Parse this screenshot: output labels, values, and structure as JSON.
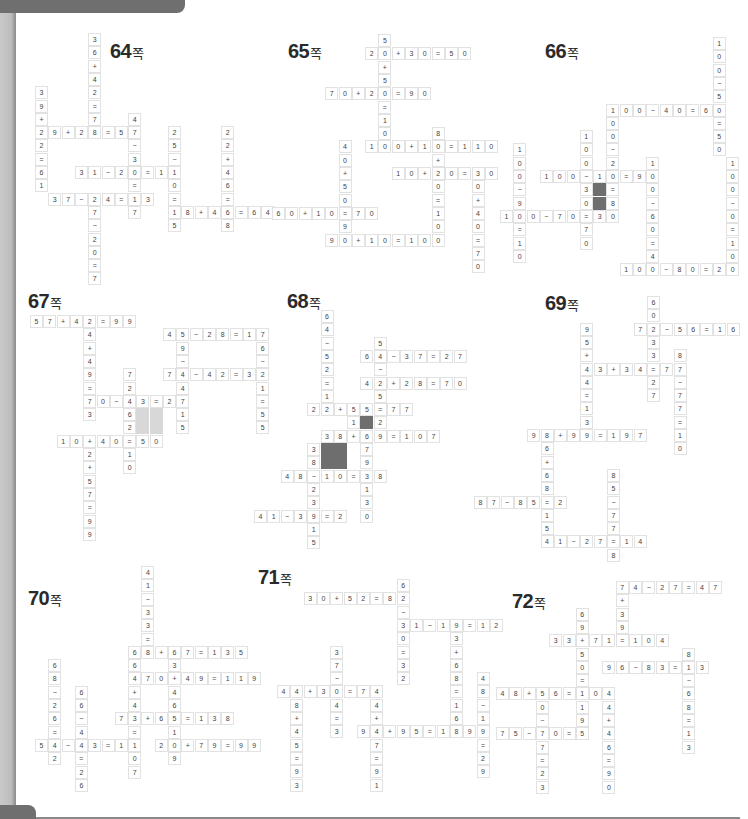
{
  "page": {
    "cell_size": 13.3,
    "shade_colors": {
      "dark": "#6e6e6e",
      "light": "#d8d8d8"
    }
  },
  "puzzles": [
    {
      "id": "p64",
      "page_label": "64",
      "unit": "쪽",
      "title_pos": [
        110,
        40
      ],
      "origin": [
        35,
        33
      ],
      "across": [
        {
          "r": 7,
          "c": 0,
          "text": "29+28=57"
        },
        {
          "r": 10,
          "c": 3,
          "text": "31-20=11"
        },
        {
          "r": 12,
          "c": 1,
          "text": "37-24=13"
        },
        {
          "r": 13,
          "c": 10,
          "text": "18+46=64"
        }
      ],
      "down": [
        {
          "r": 4,
          "c": 0,
          "text": "39+22=61"
        },
        {
          "r": 0,
          "c": 4,
          "text": "36+42=78"
        },
        {
          "r": 12,
          "c": 4,
          "text": "27-20=7"
        },
        {
          "r": 6,
          "c": 7,
          "text": "47-30=17"
        },
        {
          "r": 7,
          "c": 10,
          "text": "25-10=15"
        },
        {
          "r": 7,
          "c": 14,
          "text": "22+46=68"
        }
      ],
      "shaded": []
    },
    {
      "id": "p65",
      "page_label": "65",
      "unit": "쪽",
      "title_pos": [
        288,
        40
      ],
      "origin": [
        272,
        34
      ],
      "across": [
        {
          "r": 1,
          "c": 7,
          "text": "20+30=50"
        },
        {
          "r": 4,
          "c": 4,
          "text": "70+20=90"
        },
        {
          "r": 8,
          "c": 7,
          "text": "100+10=110"
        },
        {
          "r": 10,
          "c": 9,
          "text": "10+20=30"
        },
        {
          "r": 13,
          "c": 0,
          "text": "60+10=70"
        },
        {
          "r": 15,
          "c": 4,
          "text": "90+10=100"
        }
      ],
      "down": [
        {
          "r": 0,
          "c": 8,
          "text": "50+50=100"
        },
        {
          "r": 8,
          "c": 5,
          "text": "40+50=90"
        },
        {
          "r": 7,
          "c": 12,
          "text": "80+20=100"
        },
        {
          "r": 10,
          "c": 15,
          "text": "30+40=70"
        }
      ],
      "shaded": []
    },
    {
      "id": "p66",
      "page_label": "66",
      "unit": "쪽",
      "title_pos": [
        545,
        40
      ],
      "origin": [
        500,
        37
      ],
      "across": [
        {
          "r": 5,
          "c": 8,
          "text": "100-40=60"
        },
        {
          "r": 10,
          "c": 3,
          "text": "100-10=90"
        },
        {
          "r": 13,
          "c": 0,
          "text": "100-70=30"
        },
        {
          "r": 17,
          "c": 9,
          "text": "100-80=20"
        }
      ],
      "down": [
        {
          "r": 0,
          "c": 16,
          "text": "100-50=50"
        },
        {
          "r": 5,
          "c": 8,
          "text": "100-20=80"
        },
        {
          "r": 7,
          "c": 6,
          "text": "100-30=70"
        },
        {
          "r": 8,
          "c": 1,
          "text": "100-90=10"
        },
        {
          "r": 9,
          "c": 11,
          "text": "100-60=40"
        },
        {
          "r": 9,
          "c": 17,
          "text": "100-0=100"
        }
      ],
      "shaded": [
        {
          "r": 11,
          "c": 7,
          "type": "dark"
        },
        {
          "r": 12,
          "c": 7,
          "type": "dark"
        }
      ]
    },
    {
      "id": "p67",
      "page_label": "67",
      "unit": "쪽",
      "title_pos": [
        28,
        290
      ],
      "origin": [
        30,
        315
      ],
      "across": [
        {
          "r": 0,
          "c": 0,
          "text": "57+42=99"
        },
        {
          "r": 1,
          "c": 10,
          "text": "45-28=17"
        },
        {
          "r": 4,
          "c": 10,
          "text": "74-42=32"
        },
        {
          "r": 6,
          "c": 4,
          "text": "70-43=27"
        },
        {
          "r": 9,
          "c": 2,
          "text": "10+40=50"
        }
      ],
      "down": [
        {
          "r": 0,
          "c": 4,
          "text": "24+49=73"
        },
        {
          "r": 9,
          "c": 4,
          "text": "42+57=99"
        },
        {
          "r": 4,
          "c": 7,
          "text": "72-62=10"
        },
        {
          "r": 1,
          "c": 11,
          "text": "59-44=15"
        },
        {
          "r": 1,
          "c": 17,
          "text": "76-21=55"
        }
      ],
      "shaded": [
        {
          "r": 7,
          "c": 8,
          "type": "light"
        },
        {
          "r": 7,
          "c": 9,
          "type": "light"
        },
        {
          "r": 8,
          "c": 8,
          "type": "light"
        },
        {
          "r": 8,
          "c": 9,
          "type": "light"
        }
      ]
    },
    {
      "id": "p68",
      "page_label": "68",
      "unit": "쪽",
      "title_pos": [
        287,
        290
      ],
      "origin": [
        254,
        310
      ],
      "across": [
        {
          "r": 3,
          "c": 8,
          "text": "64-37=27"
        },
        {
          "r": 5,
          "c": 8,
          "text": "42+28=70"
        },
        {
          "r": 7,
          "c": 4,
          "text": "22+55=77"
        },
        {
          "r": 9,
          "c": 5,
          "text": "38+69=107"
        },
        {
          "r": 12,
          "c": 2,
          "text": "48-10=38"
        },
        {
          "r": 15,
          "c": 0,
          "text": "41-39=2"
        }
      ],
      "down": [
        {
          "r": 0,
          "c": 5,
          "text": "64-52=12"
        },
        {
          "r": 2,
          "c": 9,
          "text": "54-25=29"
        },
        {
          "r": 8,
          "c": 7,
          "text": "1"
        },
        {
          "r": 10,
          "c": 4,
          "text": "38-23=15"
        },
        {
          "r": 10,
          "c": 8,
          "text": "79-130"
        }
      ],
      "shaded": [
        {
          "r": 8,
          "c": 8,
          "type": "dark"
        },
        {
          "r": 10,
          "c": 5,
          "type": "dark"
        },
        {
          "r": 10,
          "c": 6,
          "type": "dark"
        },
        {
          "r": 11,
          "c": 5,
          "type": "dark"
        },
        {
          "r": 11,
          "c": 6,
          "type": "dark"
        }
      ]
    },
    {
      "id": "p69",
      "page_label": "69",
      "unit": "쪽",
      "title_pos": [
        545,
        292
      ],
      "origin": [
        474,
        296
      ],
      "across": [
        {
          "r": 2,
          "c": 12,
          "text": "72-56=16"
        },
        {
          "r": 5,
          "c": 8,
          "text": "43+34=77"
        },
        {
          "r": 10,
          "c": 4,
          "text": "98+99=197"
        },
        {
          "r": 15,
          "c": 0,
          "text": "87-85=2"
        },
        {
          "r": 18,
          "c": 5,
          "text": "41-27=14"
        }
      ],
      "down": [
        {
          "r": 0,
          "c": 13,
          "text": "60-33=27"
        },
        {
          "r": 2,
          "c": 8,
          "text": "95+44=139"
        },
        {
          "r": 4,
          "c": 15,
          "text": "87-77=10"
        },
        {
          "r": 10,
          "c": 5,
          "text": "86+68=154"
        },
        {
          "r": 13,
          "c": 10,
          "text": "85-77=8"
        }
      ],
      "shaded": []
    },
    {
      "id": "p70",
      "page_label": "70",
      "unit": "쪽",
      "title_pos": [
        28,
        587
      ],
      "origin": [
        35,
        566
      ],
      "across": [
        {
          "r": 6,
          "c": 7,
          "text": "68+67=135"
        },
        {
          "r": 8,
          "c": 8,
          "text": "70+49=119"
        },
        {
          "r": 11,
          "c": 6,
          "text": "73+65=138"
        },
        {
          "r": 13,
          "c": 0,
          "text": "54-43=11"
        },
        {
          "r": 13,
          "c": 9,
          "text": "20+79=99"
        }
      ],
      "down": [
        {
          "r": 0,
          "c": 8,
          "text": "41-33=8"
        },
        {
          "r": 6,
          "c": 10,
          "text": "63+46=109"
        },
        {
          "r": 7,
          "c": 1,
          "text": "68-26=42"
        },
        {
          "r": 7,
          "c": 7,
          "text": "64+43=107"
        },
        {
          "r": 9,
          "c": 3,
          "text": "66-40=26"
        }
      ],
      "shaded": []
    },
    {
      "id": "p71",
      "page_label": "71",
      "unit": "쪽",
      "title_pos": [
        258,
        566
      ],
      "origin": [
        277,
        579
      ],
      "across": [
        {
          "r": 1,
          "c": 2,
          "text": "30+52=82"
        },
        {
          "r": 3,
          "c": 9,
          "text": "31-19=12"
        },
        {
          "r": 8,
          "c": 0,
          "text": "44+30=74"
        },
        {
          "r": 11,
          "c": 6,
          "text": "94+95=189"
        }
      ],
      "down": [
        {
          "r": 0,
          "c": 9,
          "text": "62-30=32"
        },
        {
          "r": 5,
          "c": 4,
          "text": "37-34=3"
        },
        {
          "r": 3,
          "c": 13,
          "text": "93+68=161"
        },
        {
          "r": 8,
          "c": 1,
          "text": "48+45=93"
        },
        {
          "r": 8,
          "c": 7,
          "text": "44+47=91"
        },
        {
          "r": 7,
          "c": 15,
          "text": "48-19=29"
        }
      ],
      "shaded": []
    },
    {
      "id": "p72",
      "page_label": "72",
      "unit": "쪽",
      "title_pos": [
        512,
        590
      ],
      "origin": [
        496,
        581
      ],
      "across": [
        {
          "r": 0,
          "c": 9,
          "text": "74-27=47"
        },
        {
          "r": 4,
          "c": 4,
          "text": "33+71=104"
        },
        {
          "r": 6,
          "c": 8,
          "text": "96-83=13"
        },
        {
          "r": 8,
          "c": 0,
          "text": "48+56=104"
        },
        {
          "r": 11,
          "c": 0,
          "text": "75-70=5"
        }
      ],
      "down": [
        {
          "r": 0,
          "c": 9,
          "text": "7+394"
        },
        {
          "r": 2,
          "c": 6,
          "text": "69+50=119"
        },
        {
          "r": 5,
          "c": 14,
          "text": "81-68=13"
        },
        {
          "r": 8,
          "c": 3,
          "text": "50-27=23"
        },
        {
          "r": 8,
          "c": 8,
          "text": "44+46=90"
        }
      ],
      "shaded": []
    }
  ]
}
